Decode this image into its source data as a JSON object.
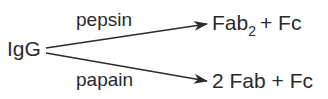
{
  "diagram": {
    "source": "IgG",
    "branches": [
      {
        "enzyme": "pepsin",
        "product_main": "Fab",
        "product_sub": "2",
        "product_rest": "+ Fc"
      },
      {
        "enzyme": "papain",
        "product_full": "2 Fab + Fc"
      }
    ],
    "colors": {
      "text": "#2a2a2a",
      "arrow": "#2a2a2a",
      "background": "#ffffff"
    }
  }
}
